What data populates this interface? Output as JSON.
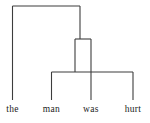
{
  "diagram": {
    "type": "syntax-tree",
    "caption": "",
    "sentence": "the man was hurt",
    "stroke_color": "#3d3d3d",
    "label_color": "#1b1b1b",
    "background_color": "#ffffff",
    "stroke_width": 1.1,
    "leaves": [
      {
        "id": "leaf-the",
        "label": "the",
        "x": 12.5,
        "y": 112
      },
      {
        "id": "leaf-man",
        "label": "man",
        "x": 51.5,
        "y": 112
      },
      {
        "id": "leaf-was",
        "label": "was",
        "x": 91.0,
        "y": 112
      },
      {
        "id": "leaf-hurt",
        "label": "hurt",
        "x": 133.0,
        "y": 112
      }
    ],
    "brackets": [
      {
        "id": "bracket-top",
        "level": 1,
        "bar_y": 6,
        "left_x": 12.5,
        "right_x": 80.0,
        "left_leg_bottom": 100,
        "right_leg_bottom": 39
      },
      {
        "id": "bracket-middle",
        "level": 2,
        "bar_y": 39,
        "left_x": 75.0,
        "right_x": 91.0,
        "left_leg_bottom": 72,
        "right_leg_bottom": 72
      },
      {
        "id": "bracket-bottom",
        "level": 3,
        "bar_y": 72,
        "left_x": 51.5,
        "right_x": 133.0,
        "left_leg_bottom": 100,
        "right_leg_bottom": 100,
        "middle_leg_x": 91.0,
        "middle_leg_bottom": 100
      }
    ]
  }
}
